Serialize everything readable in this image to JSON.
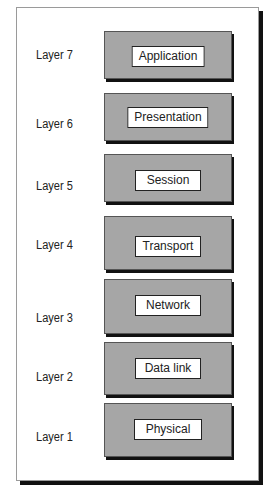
{
  "diagram": {
    "layers": [
      {
        "label": "Layer 7",
        "name": "Application",
        "box_top": 31,
        "box_h": 46,
        "label_top": 48,
        "inner_top": 14,
        "inner_w": 64
      },
      {
        "label": "Layer 6",
        "name": "Presentation",
        "box_top": 93,
        "box_h": 46,
        "label_top": 117,
        "inner_top": 13,
        "inner_w": 66
      },
      {
        "label": "Layer 5",
        "name": "Session",
        "box_top": 154,
        "box_h": 46,
        "label_top": 179,
        "inner_top": 15,
        "inner_w": 64
      },
      {
        "label": "Layer 4",
        "name": "Transport",
        "box_top": 216,
        "box_h": 52,
        "label_top": 238,
        "inner_top": 19,
        "inner_w": 64
      },
      {
        "label": "Layer 3",
        "name": "Network",
        "box_top": 279,
        "box_h": 53,
        "label_top": 311,
        "inner_top": 15,
        "inner_w": 64
      },
      {
        "label": "Layer 2",
        "name": "Data link",
        "box_top": 342,
        "box_h": 51,
        "label_top": 370,
        "inner_top": 15,
        "inner_w": 64
      },
      {
        "label": "Layer 1",
        "name": "Physical",
        "box_top": 403,
        "box_h": 52,
        "label_top": 430,
        "inner_top": 15,
        "inner_w": 66
      }
    ],
    "colors": {
      "box_fill": "#a6a6a6",
      "shadow": "#111111",
      "inner_fill": "#ffffff"
    }
  }
}
